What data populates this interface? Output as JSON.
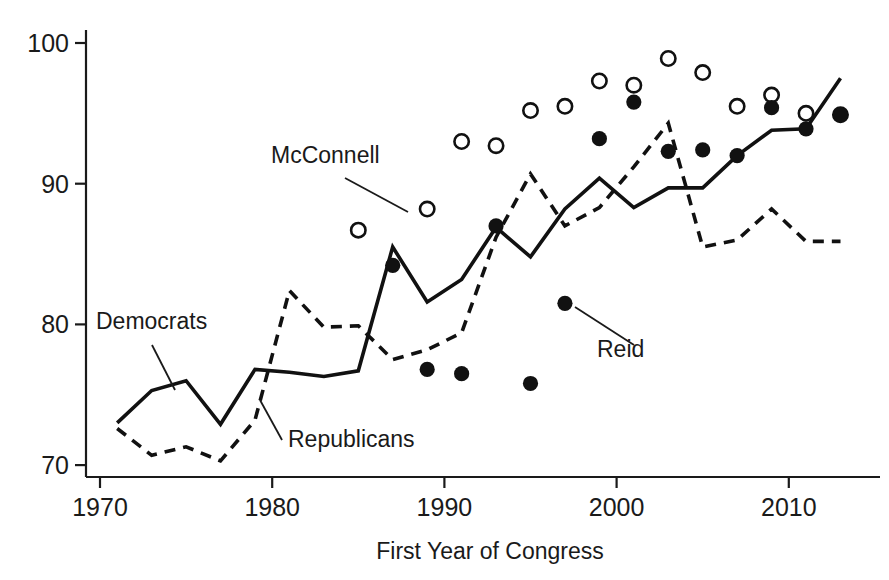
{
  "figure": {
    "background": "#ffffff",
    "ink": "#1a1a1a"
  },
  "axes": {
    "x_title": "First Year of Congress",
    "y_title": "",
    "x_ticks": [
      "1970",
      "1980",
      "1990",
      "2000",
      "2010"
    ],
    "y_ticks": [
      "70",
      "80",
      "90",
      "100"
    ]
  },
  "annotations": [
    {
      "name": "mcconnell",
      "label": "McConnell"
    },
    {
      "name": "democrats",
      "label": "Democrats"
    },
    {
      "name": "republicans",
      "label": "Republicans"
    },
    {
      "name": "reid",
      "label": "Reid"
    }
  ],
  "chart_data": {
    "type": "line",
    "title": "",
    "xlabel": "First Year of Congress",
    "ylabel": "",
    "xlim": [
      1969,
      1915
    ],
    "x_axis_range": [
      1969,
      1914
    ],
    "ylim": [
      68.5,
      101.5
    ],
    "grid": false,
    "legend": "inline-annotations",
    "x_tick_values": [
      1970,
      1980,
      1990,
      2000,
      2010
    ],
    "y_tick_values": [
      70,
      80,
      90,
      100
    ],
    "series": [
      {
        "name": "Democrats",
        "style": "solid-line",
        "color": "#111111",
        "x": [
          1971,
          1973,
          1975,
          1977,
          1979,
          1981,
          1983,
          1985,
          1987,
          1989,
          1991,
          1993,
          1995,
          1997,
          1999,
          2001,
          2003,
          2005,
          2007,
          2009,
          2011,
          2013
        ],
        "values": [
          73.0,
          75.3,
          76.0,
          72.9,
          76.8,
          76.6,
          76.3,
          76.7,
          85.5,
          81.6,
          83.2,
          86.9,
          84.8,
          88.2,
          90.4,
          88.3,
          89.7,
          89.7,
          92.0,
          93.8,
          93.9,
          97.5
        ]
      },
      {
        "name": "Republicans",
        "style": "dashed-line",
        "color": "#111111",
        "x": [
          1971,
          1973,
          1975,
          1977,
          1979,
          1981,
          1983,
          1985,
          1987,
          1989,
          1991,
          1993,
          1995,
          1997,
          1999,
          2001,
          2003,
          2005,
          2007,
          2009,
          2011,
          2013
        ],
        "values": [
          72.6,
          70.7,
          71.3,
          70.3,
          73.2,
          82.4,
          79.8,
          79.9,
          77.5,
          78.2,
          79.4,
          86.2,
          90.7,
          87.0,
          88.3,
          91.2,
          94.3,
          85.5,
          86.0,
          88.2,
          85.9,
          85.9
        ]
      },
      {
        "name": "McConnell",
        "style": "open-circles",
        "color": "#111111",
        "x": [
          1985,
          1989,
          1991,
          1993,
          1995,
          1997,
          1999,
          2001,
          2003,
          2005,
          2007,
          2009,
          2011,
          2013
        ],
        "values": [
          86.7,
          88.2,
          93.0,
          92.7,
          95.2,
          95.5,
          97.3,
          97.0,
          98.9,
          97.9,
          95.5,
          96.3,
          95.0,
          94.9
        ]
      },
      {
        "name": "Reid",
        "style": "filled-circles",
        "color": "#111111",
        "x": [
          1987,
          1989,
          1991,
          1993,
          1995,
          1997,
          1999,
          2001,
          2003,
          2005,
          2007,
          2009,
          2011,
          2013
        ],
        "values": [
          84.2,
          76.8,
          76.5,
          87.0,
          75.8,
          81.5,
          93.2,
          95.8,
          92.3,
          92.4,
          92.0,
          95.4,
          93.9,
          94.9
        ]
      }
    ]
  }
}
